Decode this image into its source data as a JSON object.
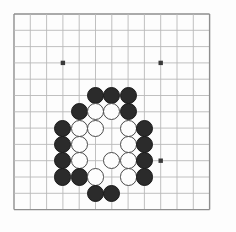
{
  "app": {
    "title": "Go Board Position",
    "board_kind": "go-board"
  },
  "board": {
    "size": 13,
    "origin_x": 14,
    "origin_y": 14,
    "cell": 16.3,
    "line_color": "#b9b9b9",
    "edge_color": "#8e8e8e",
    "background_color": "#fdfdfd",
    "star_point_color": "#3a3a3a",
    "star_point_radius": 2.2,
    "stone_radius": 8.6,
    "black_color": "#2b2b2b",
    "white_color": "#fdfdfd",
    "white_outline_color": "#4a4a4a",
    "star_points": [
      {
        "col": 3,
        "row": 3
      },
      {
        "col": 9,
        "row": 3
      },
      {
        "col": 3,
        "row": 9
      },
      {
        "col": 9,
        "row": 9
      },
      {
        "col": 6,
        "row": 6
      }
    ],
    "visible_star_points": [
      {
        "col": 3,
        "row": 3
      },
      {
        "col": 9,
        "row": 3
      },
      {
        "col": 9,
        "row": 9
      }
    ],
    "stones": [
      {
        "col": 5,
        "row": 5,
        "color": "black"
      },
      {
        "col": 6,
        "row": 5,
        "color": "black"
      },
      {
        "col": 7,
        "row": 5,
        "color": "black"
      },
      {
        "col": 4,
        "row": 6,
        "color": "black"
      },
      {
        "col": 5,
        "row": 6,
        "color": "white"
      },
      {
        "col": 6,
        "row": 6,
        "color": "white"
      },
      {
        "col": 7,
        "row": 6,
        "color": "black"
      },
      {
        "col": 3,
        "row": 7,
        "color": "black"
      },
      {
        "col": 4,
        "row": 7,
        "color": "white"
      },
      {
        "col": 5,
        "row": 7,
        "color": "white"
      },
      {
        "col": 7,
        "row": 7,
        "color": "white"
      },
      {
        "col": 8,
        "row": 7,
        "color": "black"
      },
      {
        "col": 3,
        "row": 8,
        "color": "black"
      },
      {
        "col": 4,
        "row": 8,
        "color": "white"
      },
      {
        "col": 7,
        "row": 8,
        "color": "white"
      },
      {
        "col": 8,
        "row": 8,
        "color": "black"
      },
      {
        "col": 3,
        "row": 9,
        "color": "black"
      },
      {
        "col": 4,
        "row": 9,
        "color": "white"
      },
      {
        "col": 6,
        "row": 9,
        "color": "white"
      },
      {
        "col": 7,
        "row": 9,
        "color": "white"
      },
      {
        "col": 8,
        "row": 9,
        "color": "black"
      },
      {
        "col": 3,
        "row": 10,
        "color": "black"
      },
      {
        "col": 4,
        "row": 10,
        "color": "black"
      },
      {
        "col": 5,
        "row": 10,
        "color": "white"
      },
      {
        "col": 7,
        "row": 10,
        "color": "white"
      },
      {
        "col": 8,
        "row": 10,
        "color": "black"
      },
      {
        "col": 5,
        "row": 11,
        "color": "black"
      },
      {
        "col": 6,
        "row": 11,
        "color": "black"
      }
    ],
    "counts": {
      "black": 16,
      "white": 12,
      "total": 28
    }
  }
}
